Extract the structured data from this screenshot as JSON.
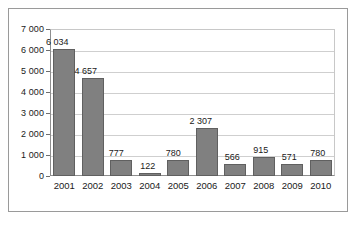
{
  "chart_data": {
    "type": "bar",
    "title": "",
    "subtitle": "",
    "xlabel": "",
    "ylabel": "",
    "categories": [
      "2001",
      "2002",
      "2003",
      "2004",
      "2005",
      "2006",
      "2007",
      "2008",
      "2009",
      "2010"
    ],
    "values": [
      6034,
      4657,
      777,
      122,
      780,
      2307,
      566,
      915,
      571,
      780
    ],
    "data_labels": [
      "6 034",
      "4 657",
      "777",
      "122",
      "780",
      "2 307",
      "566",
      "915",
      "571",
      "780"
    ],
    "ylim": [
      0,
      7000
    ],
    "y_tick_values": [
      0,
      1000,
      2000,
      3000,
      4000,
      5000,
      6000,
      7000
    ],
    "y_tick_labels": [
      "0",
      "1 000",
      "2 000",
      "3 000",
      "4 000",
      "5 000",
      "6 000",
      "7 000"
    ],
    "grid": true,
    "grid_axis": "y",
    "legend": false,
    "legend_position": "none",
    "series": [
      {
        "name": "",
        "values": [
          6034,
          4657,
          777,
          122,
          780,
          2307,
          566,
          915,
          571,
          780
        ]
      }
    ],
    "colors": {
      "bar_fill": "#808080",
      "bar_stroke": "#606060",
      "gridline": "#cfcfcf",
      "axis": "#8e8e8e",
      "frame": "#9a9a9a",
      "text": "#1a1a1a",
      "background": "#ffffff"
    }
  }
}
